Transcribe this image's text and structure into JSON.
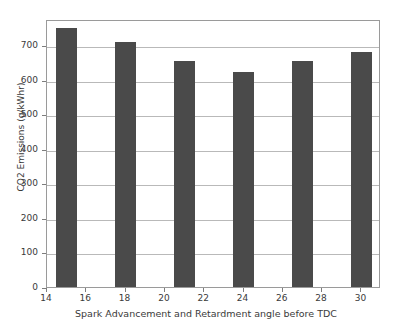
{
  "chart_data": {
    "type": "bar",
    "title": "",
    "xlabel": "Spark Advancement and Retardment angle before TDC",
    "ylabel": "CO2 Emissions (g/kWhr)",
    "x": [
      15,
      18,
      21,
      24,
      27,
      30
    ],
    "categories": [
      "15",
      "18",
      "21",
      "24",
      "27",
      "30"
    ],
    "values": [
      748,
      708,
      653,
      622,
      653,
      680
    ],
    "xlim": [
      14,
      31
    ],
    "ylim": [
      0,
      775
    ],
    "xticks": [
      14,
      16,
      18,
      20,
      22,
      24,
      26,
      28,
      30
    ],
    "xtick_labels": [
      "14",
      "16",
      "18",
      "20",
      "22",
      "24",
      "26",
      "28",
      "30"
    ],
    "yticks": [
      0,
      100,
      200,
      300,
      400,
      500,
      600,
      700
    ],
    "ytick_labels": [
      "0",
      "100",
      "200",
      "300",
      "400",
      "500",
      "600",
      "700"
    ],
    "grid": "horizontal",
    "legend": null,
    "bar_color": "#4a4a4a",
    "bar_width_units": 1.1,
    "axis_color": "#9a9a9a",
    "grid_color": "#b9b9b9",
    "background_color": "#ffffff"
  }
}
